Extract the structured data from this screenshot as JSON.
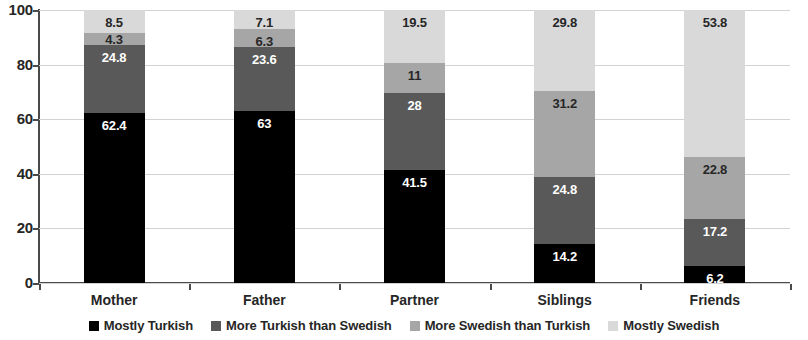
{
  "chart_data": {
    "type": "bar",
    "subtype": "stacked-bar-100",
    "title": "",
    "xlabel": "",
    "ylabel": "",
    "ylim": [
      0,
      100
    ],
    "yticks": [
      0,
      20,
      40,
      60,
      80,
      100
    ],
    "ytick_labels": [
      "0",
      "20",
      "40",
      "60",
      "80",
      "100"
    ],
    "grid": true,
    "legend_position": "bottom",
    "categories": [
      "Mother",
      "Father",
      "Partner",
      "Siblings",
      "Friends"
    ],
    "series": [
      {
        "name": "Mostly Turkish",
        "color": "#000000",
        "label_color": "#ffffff",
        "values": [
          62.4,
          63,
          41.5,
          14.2,
          6.2
        ],
        "value_labels": [
          "62.4",
          "63",
          "41.5",
          "14.2",
          "6.2"
        ]
      },
      {
        "name": "More Turkish than Swedish",
        "color": "#595959",
        "label_color": "#ffffff",
        "values": [
          24.8,
          23.6,
          28,
          24.8,
          17.2
        ],
        "value_labels": [
          "24.8",
          "23.6",
          "28",
          "24.8",
          "17.2"
        ]
      },
      {
        "name": "More Swedish than Turkish",
        "color": "#a6a6a6",
        "label_color": "#262626",
        "values": [
          4.3,
          6.3,
          11,
          31.2,
          22.8
        ],
        "value_labels": [
          "4.3",
          "6.3",
          "11",
          "31.2",
          "22.8"
        ]
      },
      {
        "name": "Mostly Swedish",
        "color": "#d9d9d9",
        "label_color": "#262626",
        "values": [
          8.5,
          7.1,
          19.5,
          29.8,
          53.8
        ],
        "value_labels": [
          "8.5",
          "7.1",
          "19.5",
          "29.8",
          "53.8"
        ]
      }
    ]
  },
  "axis": {
    "y_tick_labels": [
      "100",
      "80",
      "60",
      "40",
      "20",
      "0"
    ]
  },
  "legend": {
    "items": [
      {
        "label": "Mostly Turkish",
        "color": "#000000"
      },
      {
        "label": "More Turkish than Swedish",
        "color": "#595959"
      },
      {
        "label": "More Swedish than Turkish",
        "color": "#a6a6a6"
      },
      {
        "label": "Mostly Swedish",
        "color": "#d9d9d9"
      }
    ]
  }
}
